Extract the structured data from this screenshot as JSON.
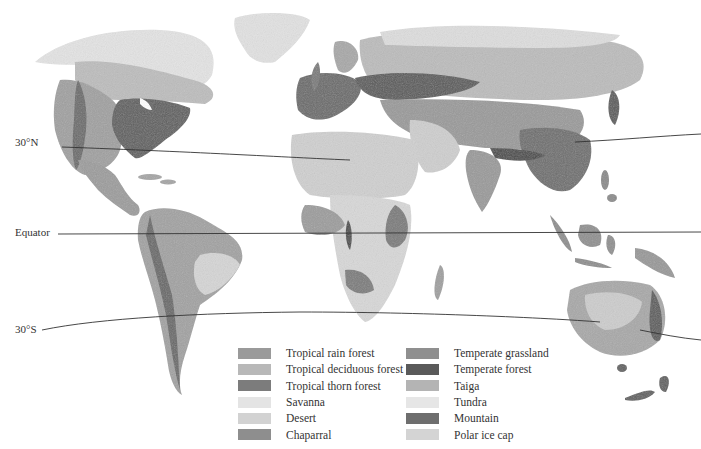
{
  "map": {
    "type": "world biome map",
    "latitude_lines": [
      {
        "label": "30°N",
        "y_left": 148
      },
      {
        "label": "Equator",
        "y_left": 234
      },
      {
        "label": "30°S",
        "y_left": 328
      }
    ]
  },
  "legend": {
    "columns": [
      [
        {
          "label": "Tropical rain forest",
          "color": "#9a9a9a"
        },
        {
          "label": "Tropical deciduous forest",
          "color": "#b8b8b8"
        },
        {
          "label": "Tropical thorn forest",
          "color": "#7c7c7c"
        },
        {
          "label": "Savanna",
          "color": "#e4e4e4"
        },
        {
          "label": "Desert",
          "color": "#d2d2d2"
        },
        {
          "label": "Chaparral",
          "color": "#8e8e8e"
        }
      ],
      [
        {
          "label": "Temperate grassland",
          "color": "#8f8f8f"
        },
        {
          "label": "Temperate forest",
          "color": "#5a5a5a"
        },
        {
          "label": "Taiga",
          "color": "#b4b4b4"
        },
        {
          "label": "Tundra",
          "color": "#e6e6e6"
        },
        {
          "label": "Mountain",
          "color": "#6e6e6e"
        },
        {
          "label": "Polar ice cap",
          "color": "#d4d4d4"
        }
      ]
    ]
  }
}
